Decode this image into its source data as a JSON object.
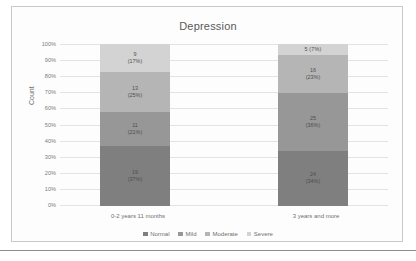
{
  "chart_data": {
    "type": "bar",
    "stacked": true,
    "normalized": true,
    "title": "Depression",
    "xlabel": "",
    "ylabel": "Count",
    "ylim": [
      0,
      100
    ],
    "ytick_labels": [
      "100%",
      "90%",
      "80%",
      "70%",
      "60%",
      "50%",
      "40%",
      "30%",
      "20%",
      "10%",
      "0%"
    ],
    "ytick_values": [
      100,
      90,
      80,
      70,
      60,
      50,
      40,
      30,
      20,
      10,
      0
    ],
    "grid": true,
    "legend_position": "bottom",
    "categories": [
      "0-2 years 11 months",
      "3 years and more"
    ],
    "series": [
      {
        "name": "Normal",
        "color": "#7f7f7f",
        "values": [
          19,
          24
        ],
        "percents": [
          37,
          34
        ],
        "labels": [
          "19\n(37%)",
          "24\n(34%)"
        ]
      },
      {
        "name": "Mild",
        "color": "#979797",
        "values": [
          11,
          25
        ],
        "percents": [
          21,
          36
        ],
        "labels": [
          "11\n(21%)",
          "25\n(36%)"
        ]
      },
      {
        "name": "Moderate",
        "color": "#b5b5b5",
        "values": [
          13,
          16
        ],
        "percents": [
          25,
          23
        ],
        "labels": [
          "13\n(25%)",
          "16\n(23%)"
        ]
      },
      {
        "name": "Severe",
        "color": "#d3d3d3",
        "values": [
          9,
          5
        ],
        "percents": [
          17,
          7
        ],
        "labels": [
          "9\n(17%)",
          "5    (7%)"
        ]
      }
    ],
    "totals": [
      52,
      70
    ]
  },
  "chart": {
    "title": "Depression",
    "yaxis_title": "Count",
    "yticks": [
      {
        "label": "100%"
      },
      {
        "label": "90%"
      },
      {
        "label": "80%"
      },
      {
        "label": "70%"
      },
      {
        "label": "60%"
      },
      {
        "label": "50%"
      },
      {
        "label": "40%"
      },
      {
        "label": "30%"
      },
      {
        "label": "20%"
      },
      {
        "label": "10%"
      },
      {
        "label": "0%"
      }
    ],
    "categories": [
      {
        "label": "0-2 years 11 months"
      },
      {
        "label": "3 years and more"
      }
    ],
    "legend": [
      {
        "label": "Normal",
        "color": "#7f7f7f"
      },
      {
        "label": "Mild",
        "color": "#979797"
      },
      {
        "label": "Moderate",
        "color": "#b5b5b5"
      },
      {
        "label": "Severe",
        "color": "#d3d3d3"
      }
    ],
    "bars": [
      {
        "category": "0-2 years 11 months",
        "segments": [
          {
            "name": "Severe",
            "count": "9",
            "percent": "(17%)",
            "color": "#d3d3d3",
            "height_pct": 17
          },
          {
            "name": "Moderate",
            "count": "13",
            "percent": "(25%)",
            "color": "#b5b5b5",
            "height_pct": 25
          },
          {
            "name": "Mild",
            "count": "11",
            "percent": "(21%)",
            "color": "#979797",
            "height_pct": 21
          },
          {
            "name": "Normal",
            "count": "19",
            "percent": "(37%)",
            "color": "#7f7f7f",
            "height_pct": 37
          }
        ]
      },
      {
        "category": "3 years and more",
        "segments": [
          {
            "name": "Severe",
            "count": "5",
            "percent": "(7%)",
            "color": "#d3d3d3",
            "height_pct": 7
          },
          {
            "name": "Moderate",
            "count": "16",
            "percent": "(23%)",
            "color": "#b5b5b5",
            "height_pct": 23
          },
          {
            "name": "Mild",
            "count": "25",
            "percent": "(36%)",
            "color": "#979797",
            "height_pct": 36
          },
          {
            "name": "Normal",
            "count": "24",
            "percent": "(34%)",
            "color": "#7f7f7f",
            "height_pct": 34
          }
        ]
      }
    ]
  }
}
